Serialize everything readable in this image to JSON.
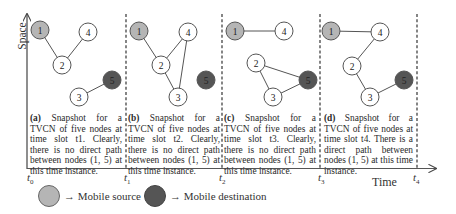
{
  "axes": {
    "y_label": "Space",
    "x_label": "Time",
    "ticks": [
      {
        "base": "t",
        "sub": "0"
      },
      {
        "base": "t",
        "sub": "1"
      },
      {
        "base": "t",
        "sub": "2"
      },
      {
        "base": "t",
        "sub": "3"
      },
      {
        "base": "t",
        "sub": "4"
      }
    ]
  },
  "colors": {
    "source": "#b5b5b5",
    "destination": "#555555",
    "normal": "#ffffff",
    "edge": "#555555"
  },
  "panels": [
    {
      "id": "a",
      "caption_tag": "(a)",
      "caption": " Snapshot for a TVCN of five nodes at time slot t1. Clearly, there is no direct path between nodes (1, 5) at this time instance.",
      "nodes": [
        {
          "id": "1",
          "x": 40,
          "y": 30,
          "type": "source"
        },
        {
          "id": "4",
          "x": 88,
          "y": 32,
          "type": "normal"
        },
        {
          "id": "2",
          "x": 62,
          "y": 65,
          "type": "normal"
        },
        {
          "id": "5",
          "x": 112,
          "y": 80,
          "type": "destination"
        },
        {
          "id": "3",
          "x": 79,
          "y": 97,
          "type": "normal"
        }
      ],
      "edges": [
        [
          "1",
          "2"
        ],
        [
          "2",
          "4"
        ],
        [
          "3",
          "5"
        ]
      ]
    },
    {
      "id": "b",
      "caption_tag": "(b)",
      "caption": " Snapshot for a TVCN of five nodes at time slot t2. Clearly, there is no direct path between nodes (1, 5) at this time instance.",
      "nodes": [
        {
          "id": "1",
          "x": 139,
          "y": 31,
          "type": "source"
        },
        {
          "id": "4",
          "x": 188,
          "y": 32,
          "type": "normal"
        },
        {
          "id": "2",
          "x": 161,
          "y": 65,
          "type": "normal"
        },
        {
          "id": "5",
          "x": 206,
          "y": 80,
          "type": "destination"
        },
        {
          "id": "3",
          "x": 178,
          "y": 97,
          "type": "normal"
        }
      ],
      "edges": [
        [
          "1",
          "2"
        ],
        [
          "2",
          "4"
        ],
        [
          "2",
          "3"
        ],
        [
          "3",
          "4"
        ]
      ]
    },
    {
      "id": "c",
      "caption_tag": "(c)",
      "caption": " Snapshot for a TVCN of five nodes at time slot t3. Clearly, there is no direct path between nodes (1, 5) at this time instance.",
      "nodes": [
        {
          "id": "1",
          "x": 235,
          "y": 31,
          "type": "source"
        },
        {
          "id": "4",
          "x": 284,
          "y": 31,
          "type": "normal"
        },
        {
          "id": "2",
          "x": 256,
          "y": 63,
          "type": "normal"
        },
        {
          "id": "5",
          "x": 308,
          "y": 80,
          "type": "destination"
        },
        {
          "id": "3",
          "x": 273,
          "y": 97,
          "type": "normal"
        }
      ],
      "edges": [
        [
          "1",
          "4"
        ],
        [
          "2",
          "5"
        ],
        [
          "2",
          "3"
        ],
        [
          "3",
          "5"
        ]
      ]
    },
    {
      "id": "d",
      "caption_tag": "(d)",
      "caption": " Snapshot for a TVCN of five nodes at time slot t4. There is a direct path between nodes (1, 5) at this time instance.",
      "nodes": [
        {
          "id": "1",
          "x": 331,
          "y": 31,
          "type": "source"
        },
        {
          "id": "4",
          "x": 380,
          "y": 32,
          "type": "normal"
        },
        {
          "id": "2",
          "x": 352,
          "y": 66,
          "type": "normal"
        },
        {
          "id": "5",
          "x": 404,
          "y": 80,
          "type": "destination"
        },
        {
          "id": "3",
          "x": 370,
          "y": 97,
          "type": "normal"
        }
      ],
      "edges": [
        [
          "1",
          "4"
        ],
        [
          "4",
          "2"
        ],
        [
          "2",
          "3"
        ],
        [
          "3",
          "5"
        ]
      ]
    }
  ],
  "legend": {
    "source_label": "→ Mobile source",
    "destination_label": "→ Mobile destination"
  }
}
